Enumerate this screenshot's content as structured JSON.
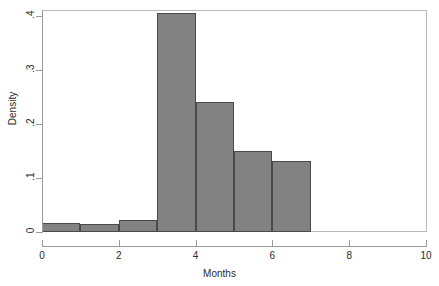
{
  "chart_data": {
    "type": "bar",
    "subtype": "histogram",
    "title": "",
    "xlabel": "Months",
    "ylabel": "Density",
    "xlim": [
      0,
      10
    ],
    "ylim": [
      0,
      0.42
    ],
    "grid": false,
    "legend": null,
    "bin_width": 1,
    "bar_color": "#828282",
    "bar_edge_color": "#4a4a4a",
    "axis_color": "#9a9a9a",
    "text_color": "#2b2b2b",
    "background": "#ffffff",
    "bins": [
      {
        "x0": 0,
        "x1": 1,
        "density": 0.017
      },
      {
        "x0": 1,
        "x1": 2,
        "density": 0.015
      },
      {
        "x0": 2,
        "x1": 3,
        "density": 0.022
      },
      {
        "x0": 3,
        "x1": 4,
        "density": 0.405
      },
      {
        "x0": 4,
        "x1": 5,
        "density": 0.241
      },
      {
        "x0": 5,
        "x1": 6,
        "density": 0.15
      },
      {
        "x0": 6,
        "x1": 7,
        "density": 0.131
      }
    ],
    "categories": [
      "0-1",
      "1-2",
      "2-3",
      "3-4",
      "4-5",
      "5-6",
      "6-7"
    ],
    "values": [
      0.017,
      0.015,
      0.022,
      0.405,
      0.241,
      0.15,
      0.131
    ],
    "xticks": [
      {
        "value": 0,
        "label": "0"
      },
      {
        "value": 2,
        "label": "2"
      },
      {
        "value": 4,
        "label": "4"
      },
      {
        "value": 6,
        "label": "6"
      },
      {
        "value": 8,
        "label": "8"
      },
      {
        "value": 10,
        "label": "10"
      }
    ],
    "yticks": [
      {
        "value": 0,
        "label": "0"
      },
      {
        "value": 0.1,
        "label": ".1"
      },
      {
        "value": 0.2,
        "label": ".2"
      },
      {
        "value": 0.3,
        "label": ".3"
      },
      {
        "value": 0.4,
        "label": ".4"
      }
    ]
  }
}
